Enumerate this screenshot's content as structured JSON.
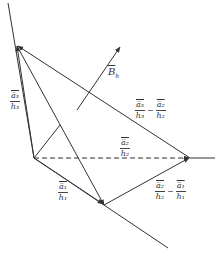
{
  "diagram": {
    "type": "vector-geometry",
    "colors": {
      "line": "#333333",
      "background": "#ffffff"
    },
    "labels": {
      "a3_over_h3": {
        "num": "a̅₃",
        "den": "h₃"
      },
      "a1_over_h1": {
        "num": "a̅₁",
        "den": "h₁"
      },
      "a2_over_h2": {
        "num": "a̅₂",
        "den": "h₂"
      },
      "diff_32": {
        "left_num": "a̅₃",
        "left_den": "h₃",
        "minus": "−",
        "right_num": "a̅₂",
        "right_den": "h₂"
      },
      "diff_21": {
        "left_num": "a̅₂",
        "left_den": "h₂",
        "minus": "−",
        "right_num": "a̅₁",
        "right_den": "h₁"
      },
      "B_h": {
        "main": "B",
        "sub": "h"
      }
    }
  }
}
